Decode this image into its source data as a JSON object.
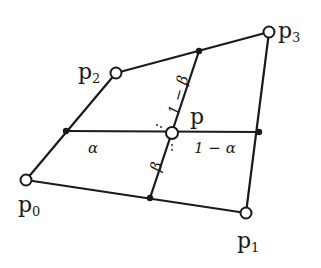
{
  "diagram": {
    "title": "",
    "colors": {
      "stroke": "#1a1a1a",
      "background": "#ffffff",
      "open_point_fill": "#ffffff"
    },
    "corners": [
      {
        "id": "p0",
        "label": "p",
        "subscript": "0",
        "x": 26,
        "y": 180
      },
      {
        "id": "p1",
        "label": "p",
        "subscript": "1",
        "x": 246,
        "y": 213
      },
      {
        "id": "p2",
        "label": "p",
        "subscript": "2",
        "x": 116,
        "y": 73
      },
      {
        "id": "p3",
        "label": "p",
        "subscript": "3",
        "x": 269,
        "y": 32
      }
    ],
    "interior_point": {
      "id": "p",
      "label": "p",
      "x": 172,
      "y": 133
    },
    "edge_points": [
      {
        "id": "top",
        "x": 199,
        "y": 51
      },
      {
        "id": "left",
        "x": 66,
        "y": 131
      },
      {
        "id": "right",
        "x": 259,
        "y": 132
      },
      {
        "id": "bottom",
        "x": 150,
        "y": 198
      }
    ],
    "parameter_labels": {
      "alpha": "α",
      "one_minus_alpha": "1 − α",
      "beta": "β",
      "one_minus_beta": "1 − β"
    }
  }
}
